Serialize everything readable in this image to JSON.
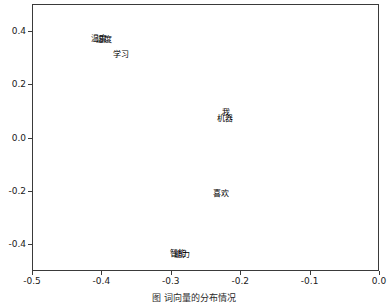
{
  "chart_data": {
    "type": "scatter",
    "title": "",
    "subtitle": "",
    "xlabel": "",
    "ylabel": "",
    "xlim": [
      -0.5,
      0.0
    ],
    "ylim": [
      -0.5,
      0.5
    ],
    "xticks": [
      "-0.5",
      "-0.4",
      "-0.3",
      "-0.2",
      "-0.1",
      "0.0"
    ],
    "xtick_values": [
      -0.5,
      -0.4,
      -0.3,
      -0.2,
      -0.1,
      0.0
    ],
    "yticks": [
      "0.4",
      "0.2",
      "0.0",
      "-0.2",
      "-0.4"
    ],
    "ytick_values": [
      0.4,
      0.2,
      0.0,
      -0.2,
      -0.4
    ],
    "grid": false,
    "legend": null,
    "marker": "text-label",
    "points": [
      {
        "label": "温度",
        "x": -0.405,
        "y": 0.377
      },
      {
        "label": "湿度",
        "x": -0.398,
        "y": 0.373
      },
      {
        "label": "学习",
        "x": -0.373,
        "y": 0.318
      },
      {
        "label": "我",
        "x": -0.222,
        "y": 0.098
      },
      {
        "label": "机器",
        "x": -0.224,
        "y": 0.075
      },
      {
        "label": "喜欢",
        "x": -0.229,
        "y": -0.205
      },
      {
        "label": "智能",
        "x": -0.291,
        "y": -0.43
      },
      {
        "label": "能力",
        "x": -0.286,
        "y": -0.432
      }
    ]
  },
  "caption": {
    "figure_label": "图",
    "text": "词向量的分布情况"
  }
}
